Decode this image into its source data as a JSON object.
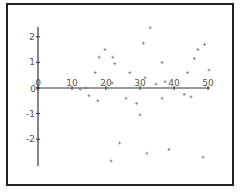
{
  "chart_data": {
    "type": "scatter",
    "title": "",
    "xlabel": "",
    "ylabel": "",
    "xlim": [
      0,
      50
    ],
    "ylim": [
      -3,
      2.4
    ],
    "x_ticks": [
      0,
      10,
      20,
      30,
      40,
      50
    ],
    "x_tick_labels": [
      "0",
      "10",
      "20",
      "30",
      "40",
      "50"
    ],
    "y_ticks": [
      2,
      1,
      0,
      -1,
      -2
    ],
    "y_tick_labels": [
      "2",
      "1",
      "0",
      "-1",
      "-2"
    ],
    "grid": false,
    "legend": null,
    "marker": "plus",
    "marker_color": "#777777",
    "axis_color": "#333333",
    "series": [
      {
        "name": "data",
        "points": [
          [
            33,
            2.35
          ],
          [
            31,
            1.75
          ],
          [
            19.7,
            1.5
          ],
          [
            18,
            1.2
          ],
          [
            22,
            1.2
          ],
          [
            22.6,
            0.95
          ],
          [
            49,
            1.7
          ],
          [
            47,
            1.5
          ],
          [
            46,
            1.15
          ],
          [
            36.5,
            1.0
          ],
          [
            16.8,
            0.6
          ],
          [
            27,
            0.6
          ],
          [
            44,
            0.6
          ],
          [
            50.3,
            0.7
          ],
          [
            31.5,
            0.4
          ],
          [
            34.7,
            0.15
          ],
          [
            21.8,
            0.2
          ],
          [
            37.4,
            0.25
          ],
          [
            14,
            0.0
          ],
          [
            12.4,
            -0.05
          ],
          [
            15,
            -0.3
          ],
          [
            17.6,
            -0.5
          ],
          [
            25.9,
            -0.4
          ],
          [
            29,
            -0.6
          ],
          [
            36.5,
            -0.4
          ],
          [
            43,
            -0.25
          ],
          [
            45,
            -0.35
          ],
          [
            30,
            -1.05
          ],
          [
            24,
            -2.15
          ],
          [
            32,
            -2.55
          ],
          [
            38.5,
            -2.4
          ],
          [
            21.5,
            -2.85
          ],
          [
            48.5,
            -2.7
          ]
        ]
      }
    ]
  }
}
